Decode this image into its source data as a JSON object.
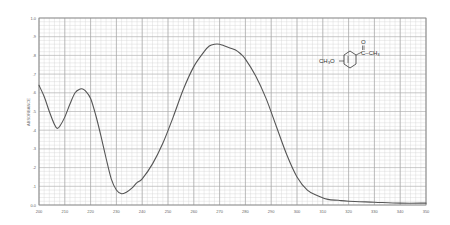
{
  "chart_data": {
    "type": "line",
    "title": "",
    "xlabel": "",
    "ylabel": "ABSORBANCE",
    "xlim": [
      200,
      350
    ],
    "ylim": [
      0.0,
      1.0
    ],
    "grid": true,
    "x_ticks": [
      200,
      210,
      220,
      230,
      240,
      250,
      260,
      270,
      280,
      290,
      300,
      310,
      320,
      330,
      340,
      350
    ],
    "y_ticks": [
      {
        "value": 0.0,
        "label": "0.0"
      },
      {
        "value": 0.1,
        "label": ".1"
      },
      {
        "value": 0.2,
        "label": ".2"
      },
      {
        "value": 0.3,
        "label": ".3"
      },
      {
        "value": 0.4,
        "label": ".4"
      },
      {
        "value": 0.5,
        "label": ".5"
      },
      {
        "value": 0.6,
        "label": ".6"
      },
      {
        "value": 0.7,
        "label": ".7"
      },
      {
        "value": 0.8,
        "label": ".8"
      },
      {
        "value": 0.9,
        "label": ".9"
      },
      {
        "value": 1.0,
        "label": "1.0"
      }
    ],
    "series": [
      {
        "name": "4-methoxyacetophenone UV spectrum",
        "color": "#555555",
        "x": [
          200,
          202,
          204,
          206,
          207,
          208,
          210,
          212,
          214,
          216,
          217,
          218,
          220,
          222,
          224,
          226,
          228,
          230,
          232,
          234,
          236,
          238,
          240,
          244,
          248,
          252,
          256,
          260,
          264,
          266,
          268,
          270,
          272,
          274,
          276,
          278,
          280,
          284,
          288,
          292,
          296,
          300,
          304,
          308,
          312,
          316,
          320,
          330,
          340,
          350
        ],
        "values": [
          0.64,
          0.58,
          0.5,
          0.43,
          0.41,
          0.42,
          0.47,
          0.54,
          0.6,
          0.62,
          0.62,
          0.61,
          0.57,
          0.48,
          0.37,
          0.25,
          0.14,
          0.08,
          0.06,
          0.07,
          0.09,
          0.12,
          0.14,
          0.22,
          0.33,
          0.47,
          0.62,
          0.74,
          0.82,
          0.85,
          0.86,
          0.86,
          0.85,
          0.84,
          0.83,
          0.81,
          0.78,
          0.69,
          0.57,
          0.42,
          0.27,
          0.15,
          0.08,
          0.05,
          0.03,
          0.025,
          0.02,
          0.015,
          0.01,
          0.01
        ]
      }
    ],
    "annotations": [
      {
        "type": "structure",
        "name": "4-methoxyacetophenone",
        "labels": [
          "CH3O",
          "O",
          "C-CH3"
        ]
      }
    ],
    "legend": "none"
  },
  "structure": {
    "left_group": "CH₃O",
    "carbonyl_o": "O",
    "right_group": "C–CH₃"
  },
  "axis": {
    "ylabel": "ABSORBANCE"
  }
}
